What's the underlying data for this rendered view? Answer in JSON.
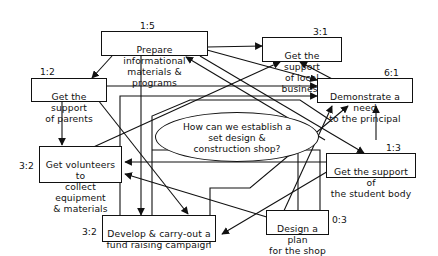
{
  "diagram": {
    "central_question": "How can we establish a\nset design &\nconstruction shop?",
    "nodes": [
      {
        "id": "prepare",
        "label": "Prepare informational\nmaterials & programs",
        "score": "1:5"
      },
      {
        "id": "local_business",
        "label": "Get the support\nof local business",
        "score": "3:1"
      },
      {
        "id": "parents",
        "label": "Get the support\nof parents",
        "score": "1:2"
      },
      {
        "id": "principal",
        "label": "Demonstrate a need\nto the principal",
        "score": "6:1"
      },
      {
        "id": "volunteers",
        "label": "Get volunteers to\ncollect equipment\n& materials",
        "score": "3:2"
      },
      {
        "id": "student_body",
        "label": "Get the support of\nthe student body",
        "score": "1:3"
      },
      {
        "id": "fund_raising",
        "label": "Develop & carry-out a\nfund raising campaign",
        "score": "3:2"
      },
      {
        "id": "plan",
        "label": "Design a plan\nfor the shop",
        "score": "0:3"
      }
    ],
    "colors": {
      "line": "#111111",
      "background": "#ffffff"
    }
  }
}
